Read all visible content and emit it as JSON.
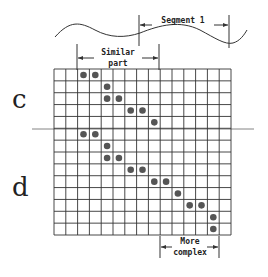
{
  "labels": {
    "segment": "Segment 1",
    "similar_line1": "Similar",
    "similar_line2": "part",
    "more_line1": "More",
    "more_line2": "complex",
    "row_c": "c",
    "row_d": "d"
  },
  "grid": {
    "cols": 15,
    "rows": 14,
    "dots": [
      [
        0,
        2
      ],
      [
        0,
        3
      ],
      [
        1,
        4
      ],
      [
        2,
        4
      ],
      [
        2,
        5
      ],
      [
        3,
        6
      ],
      [
        3,
        7
      ],
      [
        4,
        8
      ],
      [
        5,
        2
      ],
      [
        5,
        3
      ],
      [
        6,
        4
      ],
      [
        7,
        4
      ],
      [
        7,
        5
      ],
      [
        8,
        6
      ],
      [
        8,
        7
      ],
      [
        9,
        8
      ],
      [
        9,
        9
      ],
      [
        10,
        10
      ],
      [
        11,
        11
      ],
      [
        11,
        12
      ],
      [
        12,
        13
      ],
      [
        13,
        13
      ]
    ]
  },
  "colors": {
    "line": "#333333",
    "dot": "#555555"
  }
}
